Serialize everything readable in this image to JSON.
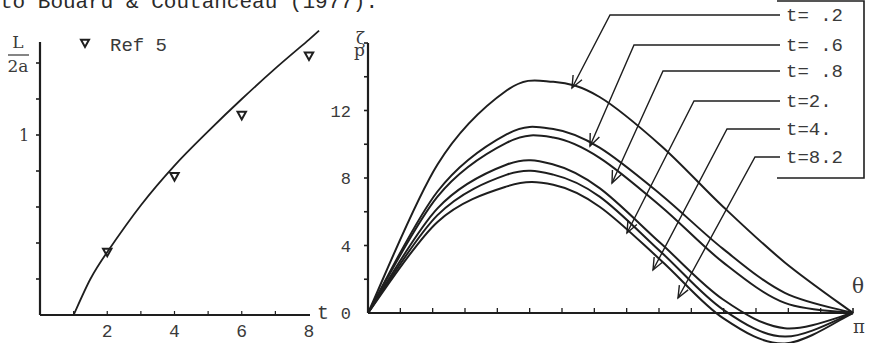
{
  "caption": "to Bouard & Coutanceau (1977).",
  "chart_data": [
    {
      "type": "line",
      "title": "",
      "xlabel": "t",
      "ylabel": "L/2a",
      "ylabel_parts": {
        "numerator": "L",
        "denominator": "2a"
      },
      "xlim": [
        0,
        8
      ],
      "ylim": [
        0,
        1.5
      ],
      "x_ticks": [
        0,
        1,
        2,
        3,
        4,
        5,
        6,
        7,
        8
      ],
      "x_tick_labels": [
        "2",
        "4",
        "6",
        "8"
      ],
      "x_tick_label_values": [
        2,
        4,
        6,
        8
      ],
      "y_ticks": [
        0,
        0.2,
        0.4,
        0.6,
        0.8,
        1.0,
        1.2,
        1.4
      ],
      "y_tick_labels": [
        "1"
      ],
      "y_tick_label_values": [
        1
      ],
      "grid": false,
      "legend": {
        "entries": [
          "Ref 5"
        ],
        "marker": "inverted-triangle",
        "position": "top-left"
      },
      "series": [
        {
          "name": "computed",
          "style": "solid-line",
          "x": [
            1.0,
            1.5,
            2.0,
            3.0,
            4.0,
            5.0,
            6.0,
            7.0,
            8.0,
            8.3
          ],
          "y": [
            0.0,
            0.2,
            0.35,
            0.61,
            0.83,
            1.02,
            1.2,
            1.37,
            1.53,
            1.58
          ]
        },
        {
          "name": "Ref 5",
          "style": "markers",
          "marker": "inverted-triangle",
          "x": [
            2.0,
            4.0,
            6.0,
            8.0
          ],
          "y": [
            0.35,
            0.77,
            1.11,
            1.44
          ]
        }
      ]
    },
    {
      "type": "line",
      "title": "",
      "xlabel": "θ",
      "x_end_label": "π",
      "ylabel": "ζp",
      "ylabel_parts": {
        "symbol": "ζ",
        "subscript": "p"
      },
      "xlim": [
        0,
        3.1416
      ],
      "ylim": [
        0,
        16
      ],
      "x_ticks_count": 15,
      "y_ticks": [
        0,
        2,
        4,
        6,
        8,
        10,
        12,
        14,
        16
      ],
      "y_tick_labels": [
        "0",
        "4",
        "8",
        "12"
      ],
      "y_tick_label_values": [
        0,
        4,
        8,
        12
      ],
      "grid": false,
      "legend": {
        "entries": [
          "t= .2",
          "t= .6",
          "t= .8",
          "t=2.",
          "t=4.",
          "t=8.2"
        ],
        "style": "boxed labels with leader arrows",
        "position": "top-right"
      },
      "series": [
        {
          "name": "t= .2",
          "theta": [
            0,
            0.45,
            0.9,
            1.2,
            1.5,
            1.9,
            2.3,
            2.7,
            3.1416
          ],
          "values": [
            0,
            8.8,
            13.2,
            13.7,
            12.8,
            9.9,
            6.3,
            3.0,
            0
          ]
        },
        {
          "name": "t= .6",
          "theta": [
            0,
            0.45,
            0.9,
            1.2,
            1.5,
            1.9,
            2.3,
            2.7,
            3.1416
          ],
          "values": [
            0,
            7.2,
            10.6,
            10.9,
            9.8,
            7.0,
            3.8,
            1.2,
            0
          ]
        },
        {
          "name": "t= .8",
          "theta": [
            0,
            0.45,
            0.9,
            1.2,
            1.5,
            1.9,
            2.3,
            2.7,
            3.1416
          ],
          "values": [
            0,
            6.9,
            10.1,
            10.4,
            9.2,
            6.3,
            3.0,
            0.6,
            0
          ]
        },
        {
          "name": "t=2.",
          "theta": [
            0,
            0.45,
            0.9,
            1.2,
            1.5,
            1.9,
            2.3,
            2.7,
            3.1416
          ],
          "values": [
            0,
            6.2,
            8.8,
            8.8,
            7.4,
            4.1,
            0.8,
            -0.9,
            0
          ]
        },
        {
          "name": "t=4.",
          "theta": [
            0,
            0.45,
            0.9,
            1.2,
            1.5,
            1.9,
            2.3,
            2.7,
            3.1416
          ],
          "values": [
            0,
            5.8,
            8.2,
            8.2,
            6.9,
            3.6,
            0.2,
            -1.4,
            0
          ]
        },
        {
          "name": "t=8.2",
          "theta": [
            0,
            0.45,
            0.9,
            1.2,
            1.5,
            1.9,
            2.3,
            2.7,
            3.1416
          ],
          "values": [
            0,
            5.4,
            7.5,
            7.6,
            6.3,
            3.1,
            -0.3,
            -1.8,
            0
          ]
        }
      ]
    }
  ]
}
